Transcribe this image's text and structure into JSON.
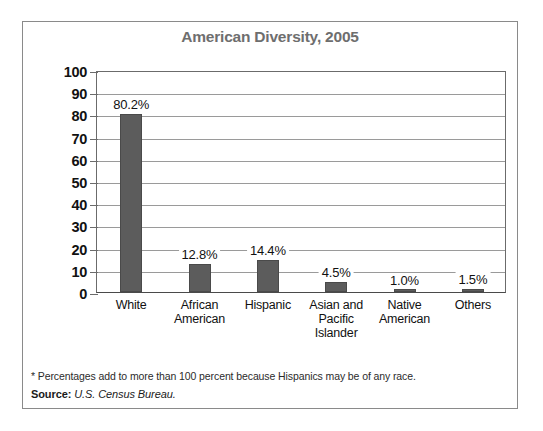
{
  "chart_data": {
    "type": "bar",
    "title": "American Diversity, 2005",
    "xlabel": "",
    "ylabel": "Percent of Total Population*",
    "ylim": [
      0,
      100
    ],
    "ytick_step": 10,
    "grid": true,
    "legend": "none",
    "categories": [
      "White",
      "African American",
      "Hispanic",
      "Asian and Pacific Islander",
      "Native American",
      "Others"
    ],
    "values": [
      80.2,
      12.8,
      14.4,
      4.5,
      1.0,
      1.5
    ],
    "data_labels": [
      "80.2%",
      "12.8%",
      "14.4%",
      "4.5%",
      "1.0%",
      "1.5%"
    ],
    "ytick_labels": [
      "100",
      "90",
      "80",
      "70",
      "60",
      "50",
      "40",
      "30",
      "20",
      "10",
      "0"
    ],
    "bar_color": "#5c5c5c",
    "title_color": "#6e6e6e",
    "gridline_color": "#9a9a9a"
  },
  "footnotes": {
    "note": "* Percentages add to more than 100 percent because Hispanics may be of any race.",
    "source_label": "Source:",
    "source_value": "U.S. Census Bureau."
  }
}
